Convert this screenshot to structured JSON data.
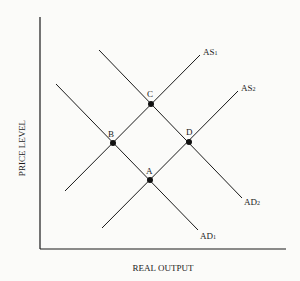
{
  "diagram": {
    "x_axis_label": "REAL OUTPUT",
    "y_axis_label": "PRICE LEVEL",
    "curves": {
      "as1": {
        "name": "AS",
        "sub": "1"
      },
      "as2": {
        "name": "AS",
        "sub": "2"
      },
      "ad1": {
        "name": "AD",
        "sub": "1"
      },
      "ad2": {
        "name": "AD",
        "sub": "2"
      }
    },
    "points": {
      "a": "A",
      "b": "B",
      "c": "C",
      "d": "D"
    },
    "colors": {
      "line": "#1a1a1a",
      "background": "#fbfbf9"
    }
  }
}
